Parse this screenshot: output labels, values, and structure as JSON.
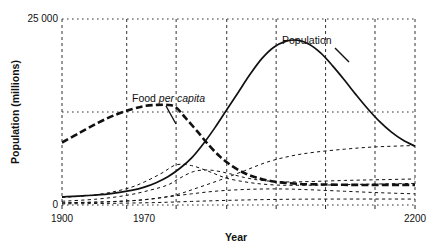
{
  "figure": {
    "background": "#ffffff",
    "ink": "#111111"
  },
  "chart_data": {
    "type": "line",
    "title": "",
    "xlabel": "Year",
    "ylabel": "Population (millions)",
    "xlim": [
      1900,
      2200
    ],
    "ylim": [
      0,
      25000
    ],
    "xticks": [
      1900,
      1970,
      2200
    ],
    "xticklabels": [
      "1900",
      "1970",
      "2200"
    ],
    "yticks": [
      0,
      25000
    ],
    "yticklabels": [
      "0",
      "25 000"
    ],
    "grid": "dashed vertical gridlines and dotted horizontal gridlines",
    "gridlines_x": [
      1900,
      1955,
      1997,
      2040,
      2082,
      2124,
      2166,
      2200
    ],
    "gridlines_y": [
      0,
      12500,
      25000
    ],
    "legend": "none (curves labelled in-plot)",
    "annotations": [
      {
        "text_plain": "Population",
        "text_pre": "Population",
        "text_italic": "",
        "text_post": "",
        "x": 2070,
        "y": 21400,
        "leader_to_x": 2110,
        "leader_to_y": 19400
      },
      {
        "text_plain": "Food per capita",
        "text_pre": "Food ",
        "text_italic": "per capita",
        "text_post": "",
        "x": 1955,
        "y": 14200,
        "leader_to_x": 1985,
        "leader_to_y": 11600
      }
    ],
    "series": [
      {
        "name": "Population",
        "style": "solid",
        "x": [
          1900,
          1920,
          1940,
          1960,
          1970,
          1980,
          1990,
          2000,
          2010,
          2020,
          2030,
          2040,
          2050,
          2060,
          2070,
          2080,
          2090,
          2100,
          2110,
          2120,
          2130,
          2140,
          2150,
          2160,
          2170,
          2180,
          2190,
          2200
        ],
        "values": [
          1100,
          1250,
          1500,
          2000,
          2400,
          3000,
          3800,
          4900,
          6300,
          8200,
          10400,
          12800,
          15200,
          17600,
          19700,
          21200,
          22000,
          22150,
          21600,
          20400,
          18700,
          16800,
          14800,
          12900,
          11200,
          9800,
          8700,
          7900
        ]
      },
      {
        "name": "Food per capita",
        "style": "thick-dashed",
        "x": [
          1900,
          1915,
          1930,
          1945,
          1960,
          1970,
          1980,
          1990,
          1997,
          2005,
          2015,
          2025,
          2035,
          2045,
          2055,
          2065,
          2080,
          2100,
          2125,
          2150,
          2175,
          2200
        ],
        "values": [
          8400,
          9700,
          11000,
          12100,
          12900,
          13300,
          13450,
          13450,
          13100,
          11700,
          9900,
          8000,
          6400,
          5200,
          4300,
          3700,
          3150,
          2850,
          2750,
          2700,
          2700,
          2700
        ]
      },
      {
        "name": "Resources",
        "style": "thin-dashed",
        "x": [
          1900,
          1930,
          1955,
          1970,
          1985,
          1997,
          2010,
          2025,
          2040,
          2060,
          2080,
          2100,
          2130,
          2160,
          2200
        ],
        "values": [
          1000,
          1400,
          2200,
          3100,
          4300,
          5400,
          5300,
          4500,
          3600,
          3000,
          2700,
          2650,
          2700,
          2800,
          2900
        ]
      },
      {
        "name": "Industrial output per capita",
        "style": "thin-dashed",
        "x": [
          1900,
          1930,
          1955,
          1975,
          1990,
          2000,
          2012,
          2025,
          2040,
          2055,
          2070,
          2090,
          2110,
          2140,
          2170,
          2200
        ],
        "values": [
          500,
          800,
          1300,
          2000,
          2700,
          3600,
          4500,
          4700,
          4300,
          3700,
          3300,
          3100,
          3150,
          3300,
          3400,
          3500
        ]
      },
      {
        "name": "Pollution",
        "style": "thin-dashed",
        "x": [
          1900,
          1940,
          1970,
          1995,
          2015,
          2035,
          2055,
          2075,
          2095,
          2115,
          2140,
          2165,
          2200
        ],
        "values": [
          300,
          450,
          700,
          1300,
          2300,
          3400,
          4600,
          5800,
          6600,
          7100,
          7500,
          7800,
          8000
        ]
      },
      {
        "name": "Services per capita",
        "style": "thin-dashed",
        "x": [
          1900,
          1935,
          1965,
          1990,
          2010,
          2030,
          2050,
          2070,
          2090,
          2110,
          2140,
          2170,
          2200
        ],
        "values": [
          250,
          400,
          650,
          1100,
          1500,
          1850,
          2050,
          2150,
          2150,
          2050,
          1850,
          1650,
          1500
        ]
      },
      {
        "name": "Baseline low series",
        "style": "thin-dashed",
        "x": [
          1900,
          1940,
          1980,
          2010,
          2040,
          2070,
          2100,
          2140,
          2200
        ],
        "values": [
          150,
          220,
          330,
          480,
          620,
          720,
          780,
          800,
          800
        ]
      }
    ]
  },
  "axes": {
    "ytick_top_label": "25 000",
    "ytick_bottom_label": "0",
    "ylabel": "Population (millions)",
    "xlabel": "Year",
    "xtick_labels": [
      "1900",
      "1970",
      "2200"
    ]
  }
}
